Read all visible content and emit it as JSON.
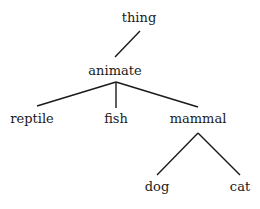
{
  "diagram": {
    "type": "tree",
    "edge_color": "#1a1a1a",
    "nodes": {
      "thing": {
        "label": "thing",
        "x": 139,
        "y": 11
      },
      "animate": {
        "label": "animate",
        "x": 115,
        "y": 64
      },
      "reptile": {
        "label": "reptile",
        "x": 32,
        "y": 112
      },
      "fish": {
        "label": "fish",
        "x": 116,
        "y": 112
      },
      "mammal": {
        "label": "mammal",
        "x": 198,
        "y": 112
      },
      "dog": {
        "label": "dog",
        "x": 157,
        "y": 180
      },
      "cat": {
        "label": "cat",
        "x": 240,
        "y": 180
      }
    },
    "edges": [
      {
        "from": "thing",
        "to": "animate"
      },
      {
        "from": "animate",
        "to": "reptile"
      },
      {
        "from": "animate",
        "to": "fish"
      },
      {
        "from": "animate",
        "to": "mammal"
      },
      {
        "from": "mammal",
        "to": "dog"
      },
      {
        "from": "mammal",
        "to": "cat"
      }
    ]
  }
}
